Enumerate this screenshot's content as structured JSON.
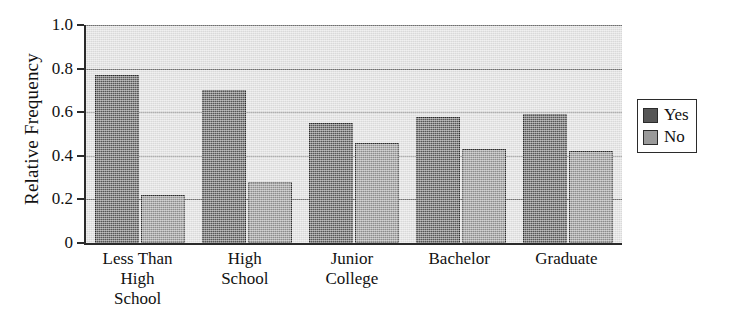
{
  "chart_data": {
    "type": "bar",
    "title": "",
    "xlabel": "",
    "ylabel": "Relative Frequency",
    "ylim": [
      0,
      1.0
    ],
    "yticks": [
      "0",
      "0.2",
      "0.4",
      "0.6",
      "0.8",
      "1.0"
    ],
    "ytick_values": [
      0,
      0.2,
      0.4,
      0.6,
      0.8,
      1.0
    ],
    "grid": true,
    "legend_position": "right",
    "categories": [
      "Less Than High School",
      "High School",
      "Junior College",
      "Bachelor",
      "Graduate"
    ],
    "category_lines": [
      [
        "Less Than",
        "High",
        "School"
      ],
      [
        "High",
        "School"
      ],
      [
        "Junior",
        "College"
      ],
      [
        "Bachelor"
      ],
      [
        "Graduate"
      ]
    ],
    "series": [
      {
        "name": "Yes",
        "color": "#565656",
        "values": [
          0.77,
          0.7,
          0.55,
          0.58,
          0.59
        ]
      },
      {
        "name": "No",
        "color": "#8d8d8d",
        "values": [
          0.22,
          0.28,
          0.46,
          0.43,
          0.42
        ]
      }
    ]
  },
  "legend": {
    "entries": [
      {
        "label": "Yes"
      },
      {
        "label": "No"
      }
    ]
  }
}
